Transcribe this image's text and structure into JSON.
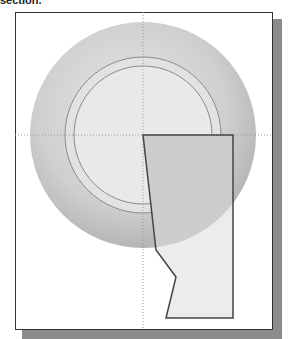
{
  "caption": {
    "text": "section."
  },
  "viewport": {
    "background": "#ffffff",
    "frame_border": "#333333",
    "shadow_color": "#8c8c8c"
  },
  "drawing": {
    "center": [
      143,
      135
    ],
    "outer_disc": {
      "radius": 113,
      "fill": "#c4c4c4"
    },
    "ring_outer": {
      "radius": 78,
      "stroke": "#888888"
    },
    "ring_inner": {
      "radius": 69,
      "stroke": "#888888"
    },
    "profile": {
      "points": [
        [
          143,
          135
        ],
        [
          233,
          135
        ],
        [
          233,
          318
        ],
        [
          166,
          318
        ],
        [
          176,
          277
        ],
        [
          156,
          250
        ]
      ],
      "stroke": "#444444",
      "fill": "#e6e6e6"
    },
    "centerlines": {
      "color": "#999999",
      "style": "dotted"
    }
  }
}
